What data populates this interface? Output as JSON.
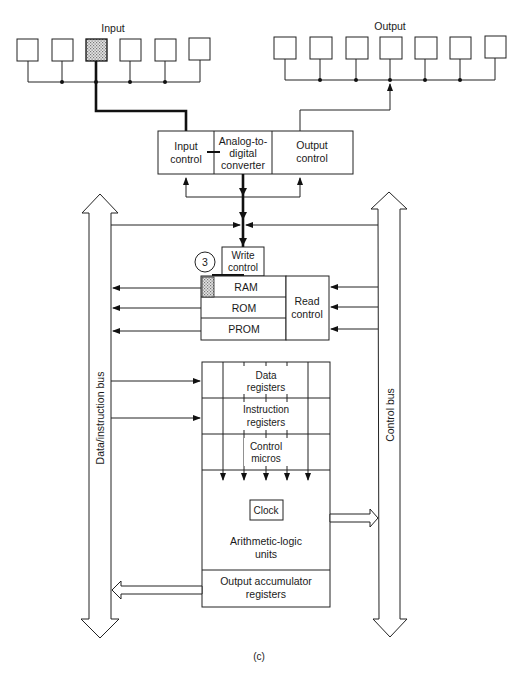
{
  "figure": {
    "caption": "(c)",
    "colors": {
      "line": "#222222",
      "background": "#ffffff",
      "shading": "#bdbdbd"
    }
  },
  "io": {
    "input_label": "Input",
    "output_label": "Output",
    "input_device_count": 6,
    "output_device_count": 7,
    "active_input_index": 2
  },
  "converter_block": {
    "input_control": [
      "Input",
      "control"
    ],
    "adc": [
      "Analog-to-",
      "digital",
      "converter"
    ],
    "output_control": [
      "Output",
      "control"
    ]
  },
  "memory": {
    "step_marker": "3",
    "write_control": [
      "Write",
      "control"
    ],
    "rows": [
      "RAM",
      "ROM",
      "PROM"
    ],
    "read_control": [
      "Read",
      "control"
    ]
  },
  "cpu": {
    "data_registers": [
      "Data",
      "registers"
    ],
    "instruction_registers": [
      "Instruction",
      "registers"
    ],
    "control_micros": [
      "Control",
      "micros"
    ],
    "clock": "Clock",
    "alu": [
      "Arithmetic-logic",
      "units"
    ],
    "output_accumulator": [
      "Output accumulator",
      "registers"
    ]
  },
  "buses": {
    "left": "Data/instruction bus",
    "right": "Control bus"
  }
}
